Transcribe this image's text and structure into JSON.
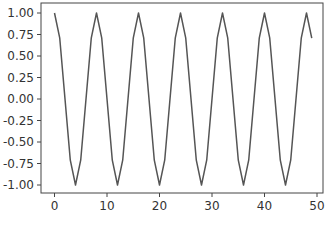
{
  "chart_data": {
    "type": "line",
    "title": "",
    "xlabel": "",
    "ylabel": "",
    "xlim": [
      -2.5,
      51.5
    ],
    "ylim": [
      -1.1,
      1.1
    ],
    "grid": false,
    "legend": null,
    "x_ticks": [
      0,
      10,
      20,
      30,
      40,
      50
    ],
    "x_tick_labels": [
      "0",
      "10",
      "20",
      "30",
      "40",
      "50"
    ],
    "y_ticks": [
      1.0,
      0.75,
      0.5,
      0.25,
      0.0,
      -0.25,
      -0.5,
      -0.75,
      -1.0
    ],
    "y_tick_labels": [
      "1.00",
      "0.75",
      "0.50",
      "0.25",
      "0.00",
      "-0.25",
      "-0.50",
      "-0.75",
      "-1.00"
    ],
    "series": [
      {
        "name": "cos(pi*x/4)",
        "color": "#555555",
        "x": [
          0,
          1,
          2,
          3,
          4,
          5,
          6,
          7,
          8,
          9,
          10,
          11,
          12,
          13,
          14,
          15,
          16,
          17,
          18,
          19,
          20,
          21,
          22,
          23,
          24,
          25,
          26,
          27,
          28,
          29,
          30,
          31,
          32,
          33,
          34,
          35,
          36,
          37,
          38,
          39,
          40,
          41,
          42,
          43,
          44,
          45,
          46,
          47,
          48,
          49
        ],
        "values": [
          1.0,
          0.707,
          0.0,
          -0.707,
          -1.0,
          -0.707,
          0.0,
          0.707,
          1.0,
          0.707,
          0.0,
          -0.707,
          -1.0,
          -0.707,
          0.0,
          0.707,
          1.0,
          0.707,
          0.0,
          -0.707,
          -1.0,
          -0.707,
          0.0,
          0.707,
          1.0,
          0.707,
          0.0,
          -0.707,
          -1.0,
          -0.707,
          0.0,
          0.707,
          1.0,
          0.707,
          0.0,
          -0.707,
          -1.0,
          -0.707,
          0.0,
          0.707,
          1.0,
          0.707,
          0.0,
          -0.707,
          -1.0,
          -0.707,
          0.0,
          0.707,
          1.0,
          0.707
        ]
      }
    ]
  },
  "style": {
    "axis_color": "#444444",
    "background": "#ffffff"
  }
}
